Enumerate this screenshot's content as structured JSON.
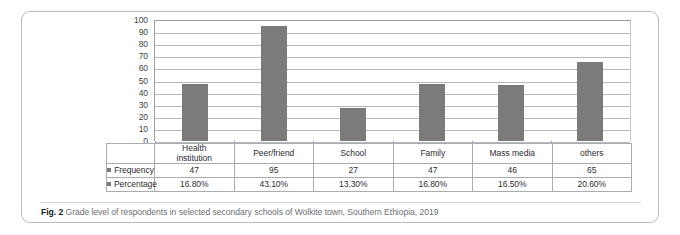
{
  "figure": {
    "caption_label": "Fig. 2",
    "caption_text": "Grade level of respondents in selected secondary schools of Wolkite town, Southern Ethiopia, 2019"
  },
  "table": {
    "row_label_frequency": "Frequency",
    "row_label_percentage": "Percentage",
    "categories": [
      {
        "line1": "Health",
        "line2": "institution"
      },
      {
        "line1": "Peer/friend",
        "line2": ""
      },
      {
        "line1": "School",
        "line2": ""
      },
      {
        "line1": "Family",
        "line2": ""
      },
      {
        "line1": "Mass media",
        "line2": ""
      },
      {
        "line1": "others",
        "line2": ""
      }
    ],
    "frequency": [
      "47",
      "95",
      "27",
      "47",
      "46",
      "65"
    ],
    "percentage": [
      "16.80%",
      "43.10%",
      "13.30%",
      "16.80%",
      "16.50%",
      "20.60%"
    ]
  },
  "colors": {
    "bar_fill": "#7b7b7b",
    "gridline": "#b5b8bc",
    "axis": "#9a9da1",
    "table_border": "#a9acb0",
    "caption_text": "#6d7073"
  },
  "chart_data": {
    "type": "bar",
    "title": "",
    "xlabel": "",
    "ylabel": "",
    "categories": [
      "Health institution",
      "Peer/friend",
      "School",
      "Family",
      "Mass media",
      "others"
    ],
    "values": [
      47,
      95,
      27,
      47,
      46,
      65
    ],
    "series": [
      {
        "name": "Frequency",
        "values": [
          47,
          95,
          27,
          47,
          46,
          65
        ]
      },
      {
        "name": "Percentage",
        "values": [
          16.8,
          43.1,
          13.3,
          16.8,
          16.5,
          20.6
        ]
      }
    ],
    "ylim": [
      0,
      100
    ],
    "ytick_labels": [
      "100",
      "90",
      "80",
      "70",
      "60",
      "50",
      "40",
      "30",
      "20",
      "10",
      "0"
    ],
    "ytick_values": [
      100,
      90,
      80,
      70,
      60,
      50,
      40,
      30,
      20,
      10,
      0
    ],
    "grid": true,
    "legend": "data-table-below",
    "legend_entries": [
      "Frequency",
      "Percentage"
    ]
  }
}
